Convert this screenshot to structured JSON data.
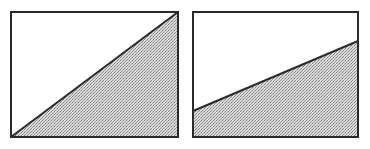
{
  "colors": {
    "background": "#ffffff",
    "stroke": "#2a2a2a",
    "fill_light": "#d8d8d8",
    "fill_dark": "#8c8c8c"
  },
  "panels": [
    {
      "name": "left-panel",
      "box": {
        "x": 11,
        "y": 12,
        "width": 167,
        "height": 125
      },
      "line": {
        "x1": 11,
        "y1": 137,
        "x2": 178,
        "y2": 12
      },
      "shaded_region": "below-line",
      "shaded_polygon": "11,137 178,12 178,137"
    },
    {
      "name": "right-panel",
      "box": {
        "x": 193,
        "y": 12,
        "width": 165,
        "height": 125
      },
      "line": {
        "x1": 193,
        "y1": 111,
        "x2": 358,
        "y2": 41
      },
      "shaded_region": "below-line",
      "shaded_polygon": "193,111 358,41 358,137 193,137"
    }
  ]
}
